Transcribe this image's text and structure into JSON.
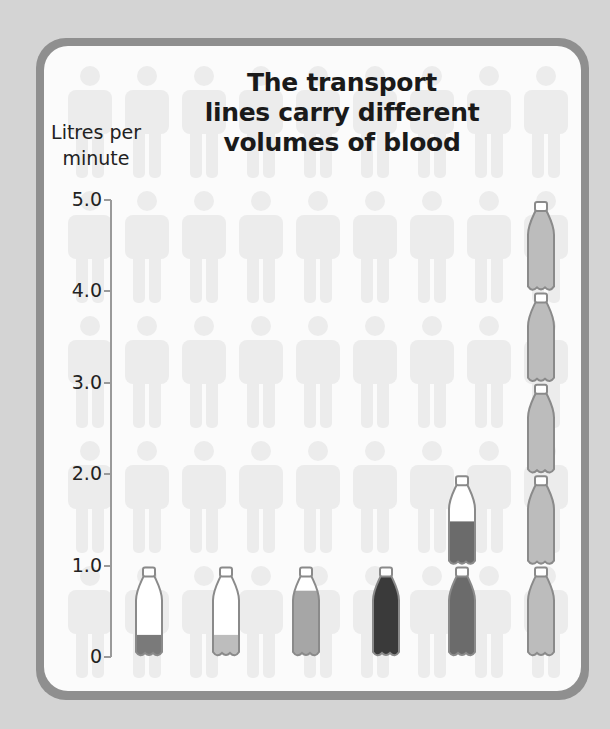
{
  "chart_data": {
    "type": "bar",
    "title": "The transport lines carry different volumes of blood",
    "title_lines": [
      "The transport",
      "lines carry different",
      "volumes of blood"
    ],
    "ylabel": "Litres per minute",
    "ylabel_lines": [
      "Litres per",
      "minute"
    ],
    "xlabel": "",
    "ylim": [
      0,
      5.0
    ],
    "yticks": [
      "0",
      "1.0",
      "2.0",
      "3.0",
      "4.0",
      "5.0"
    ],
    "grid": false,
    "legend": null,
    "categories": [
      "Bar 1",
      "Bar 2",
      "Bar 3",
      "Bar 4",
      "Bar 5",
      "Bar 6"
    ],
    "values": [
      0.25,
      0.25,
      0.75,
      1.0,
      1.5,
      5.0
    ],
    "bar_style": "pictogram: stacked bottles (1 bottle = 1.0 litre)",
    "bar_colors": [
      "#7a7a7a",
      "#bdbdbd",
      "#a6a6a6",
      "#3a3a3a",
      "#6b6b6b",
      "#bcbcbc"
    ]
  },
  "background_pictogram": "faded human silhouettes grid"
}
